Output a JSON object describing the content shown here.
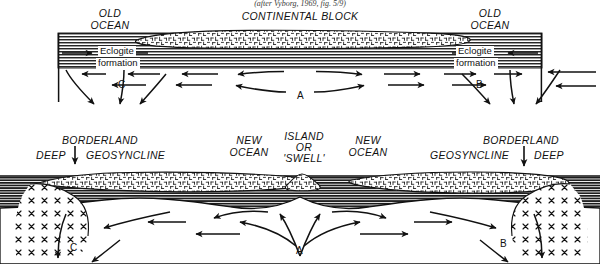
{
  "figure": {
    "caption_top": "(after Vyborg, 1969, fig. 5/9)",
    "type": "geological-cross-section-diagram",
    "panels": 2
  },
  "upper_panel": {
    "name": "single-continent-stage",
    "labels": {
      "left_ocean": "OLD\nOCEAN",
      "center_block": "CONTINENTAL BLOCK",
      "right_ocean": "OLD\nOCEAN",
      "left_eclogite_line1": "Eclogite",
      "left_eclogite_line2": "formation",
      "right_eclogite_line1": "Eclogite",
      "right_eclogite_line2": "formation",
      "point_a": "A",
      "point_b": "B",
      "point_c": "C"
    }
  },
  "lower_panel": {
    "name": "rifted-continents-stage",
    "labels": {
      "left_borderland": "BORDERLAND",
      "left_deep": "DEEP",
      "left_geosyncline": "GEOSYNCLINE",
      "new_ocean_left": "NEW\nOCEAN",
      "island_line1": "ISLAND",
      "island_line2": "OR",
      "island_line3": "'SWELL'",
      "new_ocean_right": "NEW\nOCEAN",
      "right_borderland": "BORDERLAND",
      "right_geosyncline": "GEOSYNCLINE",
      "right_deep": "DEEP",
      "point_a": "A",
      "point_b": "B",
      "point_c": "C"
    }
  },
  "colors": {
    "ink": "#111111",
    "paper": "#ffffff",
    "mantle_hatch": "#2b2b2b",
    "crust_fill": "#ffffff"
  }
}
